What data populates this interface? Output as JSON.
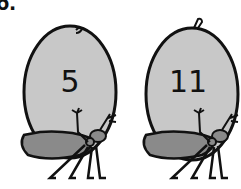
{
  "problem_label": "6.",
  "seeds": [
    {
      "number": "5"
    },
    {
      "number": "11"
    }
  ],
  "colors": {
    "seed_fill": "#c8c8c8",
    "ant_body": "#8a8a8a",
    "outline": "#111111"
  }
}
